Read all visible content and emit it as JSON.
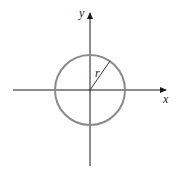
{
  "figure": {
    "x_axis_label": "x",
    "y_axis_label": "y",
    "radius_label": "r",
    "circle_color": "#8a8a8a",
    "axis_color": "#1a1a1a",
    "radius_line_color": "#333333",
    "shape": "circle centered at origin with radius r"
  }
}
